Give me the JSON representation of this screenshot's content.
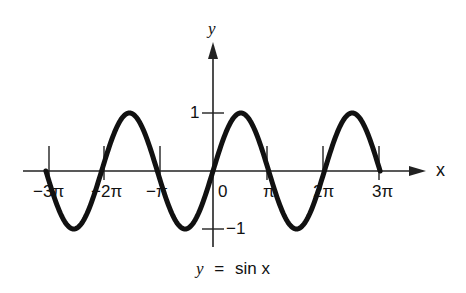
{
  "chart_data": {
    "type": "line",
    "title": "",
    "caption": "y = sin x",
    "xlabel": "x",
    "ylabel": "y",
    "function": "sin(x)",
    "xlim_radians": [
      -9.4248,
      9.4248
    ],
    "ylim": [
      -1,
      1
    ],
    "x_tick_labels": [
      "−3π",
      "−2π",
      "−π",
      "0",
      "π",
      "2π",
      "3π"
    ],
    "x_tick_values_radians": [
      -9.4248,
      -6.2832,
      -3.1416,
      0,
      3.1416,
      6.2832,
      9.4248
    ],
    "y_tick_labels": [
      "1",
      "−1"
    ],
    "y_tick_values": [
      1,
      -1
    ],
    "grid": false,
    "legend": "none",
    "series": [
      {
        "name": "y = sin x",
        "x_radians": [
          -9.4248,
          -7.854,
          -6.2832,
          -4.7124,
          -3.1416,
          -1.5708,
          0,
          1.5708,
          3.1416,
          4.7124,
          6.2832,
          7.854,
          9.4248
        ],
        "values": [
          0,
          -1,
          0,
          1,
          0,
          -1,
          0,
          1,
          0,
          -1,
          0,
          1,
          0
        ]
      }
    ],
    "colors": {
      "curve": "#111111",
      "axes": "#222222"
    }
  },
  "labels": {
    "x_axis": "x",
    "y_axis": "y",
    "x_ticks": [
      "−3π",
      "−2π",
      "−π",
      "0",
      "π",
      "2π",
      "3π"
    ],
    "y_one": "1",
    "y_minus_one": "−1",
    "caption_y": "y",
    "caption_eq": "=",
    "caption_rhs": "sin x"
  }
}
